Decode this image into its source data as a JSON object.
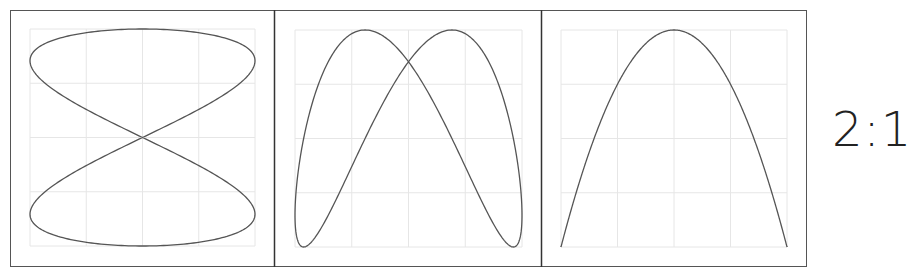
{
  "figure": {
    "ratio_label": "2:1",
    "colors": {
      "frame": "#555555",
      "divider": "#333333",
      "grid": "#e6e6e6",
      "curve": "#555555",
      "text": "#222222"
    },
    "panels": [
      {
        "id": "phase-0",
        "description": "Figure-eight Lissajous curve (frequency ratio 2:1, phase 0)",
        "shape": "figure-eight"
      },
      {
        "id": "phase-mid",
        "description": "Two overlapping arches crossing near top (intermediate phase)",
        "shape": "double-arch"
      },
      {
        "id": "phase-90",
        "description": "Parabola-like arch (degenerate Lissajous, phase 90°)",
        "shape": "parabola"
      }
    ],
    "grid": {
      "columns": 4,
      "rows": 4
    }
  }
}
